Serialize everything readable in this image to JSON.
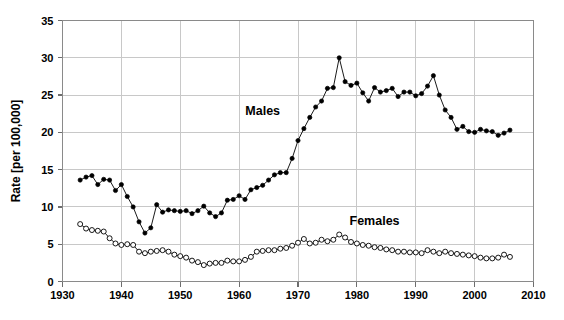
{
  "chart_data": {
    "type": "line",
    "title": "",
    "subtitle": "",
    "xlabel": "",
    "ylabel": "Rate [per 100,000]",
    "xlim": [
      1930,
      2010
    ],
    "ylim": [
      0,
      35
    ],
    "xticks": [
      1930,
      1940,
      1950,
      1960,
      1970,
      1980,
      1990,
      2000,
      2010
    ],
    "yticks": [
      0,
      5,
      10,
      15,
      20,
      25,
      30,
      35
    ],
    "grid": true,
    "legend_position": "inline-annotations",
    "annotations": [
      {
        "text": "Males",
        "x": 1964,
        "y": 22.3
      },
      {
        "text": "Females",
        "x": 1983,
        "y": 7.6
      }
    ],
    "x": [
      1933,
      1934,
      1935,
      1936,
      1937,
      1938,
      1939,
      1940,
      1941,
      1942,
      1943,
      1944,
      1945,
      1946,
      1947,
      1948,
      1949,
      1950,
      1951,
      1952,
      1953,
      1954,
      1955,
      1956,
      1957,
      1958,
      1959,
      1960,
      1961,
      1962,
      1963,
      1964,
      1965,
      1966,
      1967,
      1968,
      1969,
      1970,
      1971,
      1972,
      1973,
      1974,
      1975,
      1976,
      1977,
      1978,
      1979,
      1980,
      1981,
      1982,
      1983,
      1984,
      1985,
      1986,
      1987,
      1988,
      1989,
      1990,
      1991,
      1992,
      1993,
      1994,
      1995,
      1996,
      1997,
      1998,
      1999,
      2000,
      2001,
      2002,
      2003,
      2004,
      2005,
      2006
    ],
    "series": [
      {
        "name": "Males",
        "marker": "filled-circle",
        "color": "#000000",
        "values": [
          13.6,
          14.0,
          14.2,
          13.0,
          13.7,
          13.6,
          12.2,
          13.0,
          11.4,
          10.0,
          8.0,
          6.5,
          7.2,
          10.3,
          9.3,
          9.6,
          9.5,
          9.4,
          9.5,
          9.1,
          9.5,
          10.1,
          9.2,
          8.7,
          9.2,
          10.9,
          11.0,
          11.5,
          11.0,
          12.3,
          12.6,
          12.9,
          13.6,
          14.3,
          14.6,
          14.6,
          16.5,
          18.9,
          20.5,
          22.0,
          23.4,
          24.2,
          25.9,
          26.0,
          30.0,
          26.8,
          26.3,
          26.6,
          25.3,
          24.2,
          26.0,
          25.4,
          25.6,
          25.9,
          24.8,
          25.4,
          25.4,
          24.9,
          25.2,
          26.2,
          27.6,
          25.0,
          23.0,
          22.0,
          20.4,
          20.8,
          20.1,
          20.0,
          20.4,
          20.2,
          20.1,
          19.6,
          19.9,
          20.3
        ]
      },
      {
        "name": "Females",
        "marker": "open-circle",
        "color": "#000000",
        "values": [
          7.7,
          7.1,
          6.9,
          6.8,
          6.7,
          5.8,
          5.1,
          4.9,
          5.0,
          4.9,
          4.0,
          3.8,
          4.0,
          4.1,
          4.2,
          4.0,
          3.6,
          3.4,
          3.2,
          2.8,
          2.6,
          2.2,
          2.4,
          2.5,
          2.5,
          2.8,
          2.7,
          2.7,
          2.9,
          3.3,
          4.0,
          4.1,
          4.2,
          4.2,
          4.4,
          4.5,
          4.8,
          5.2,
          5.7,
          5.1,
          5.2,
          5.6,
          5.4,
          5.6,
          6.3,
          5.9,
          5.3,
          5.1,
          4.9,
          4.8,
          4.6,
          4.5,
          4.3,
          4.2,
          4.0,
          4.0,
          3.9,
          3.9,
          3.8,
          4.2,
          4.0,
          3.8,
          4.0,
          3.8,
          3.7,
          3.6,
          3.5,
          3.4,
          3.2,
          3.1,
          3.1,
          3.2,
          3.6,
          3.3
        ]
      }
    ]
  },
  "axes": {
    "y_title": "Rate [per 100,000]"
  }
}
